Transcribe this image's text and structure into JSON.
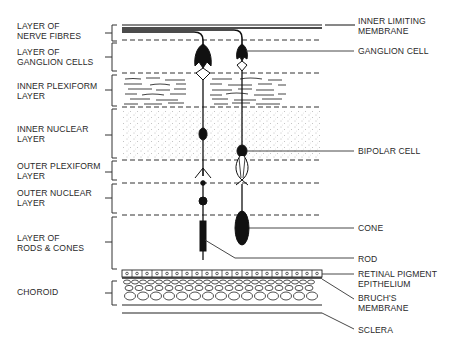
{
  "left_labels": [
    {
      "line1": "LAYER OF",
      "line2": "NERVE FIBRES"
    },
    {
      "line1": "LAYER OF",
      "line2": "GANGLION CELLS"
    },
    {
      "line1": "INNER PLEXIFORM",
      "line2": "LAYER"
    },
    {
      "line1": "INNER NUCLEAR",
      "line2": "LAYER"
    },
    {
      "line1": "OUTER PLEXIFORM",
      "line2": "LAYER"
    },
    {
      "line1": "OUTER NUCLEAR",
      "line2": "LAYER"
    },
    {
      "line1": "LAYER OF",
      "line2": "RODS & CONES"
    },
    {
      "line1": "CHOROID",
      "line2": ""
    }
  ],
  "right_labels": [
    {
      "line1": "INNER LIMITING",
      "line2": "MEMBRANE"
    },
    {
      "line1": "GANGLION CELL",
      "line2": ""
    },
    {
      "line1": "BIPOLAR CELL",
      "line2": ""
    },
    {
      "line1": "CONE",
      "line2": ""
    },
    {
      "line1": "ROD",
      "line2": ""
    },
    {
      "line1": "RETINAL PIGMENT",
      "line2": "EPITHELIUM"
    },
    {
      "line1": "BRUCH'S",
      "line2": "MEMBRANE"
    },
    {
      "line1": "SCLERA",
      "line2": ""
    }
  ],
  "colors": {
    "ink": "#1a1a1a",
    "background": "#ffffff"
  }
}
